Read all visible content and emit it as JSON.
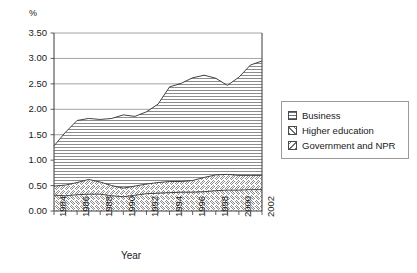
{
  "chart_data": {
    "type": "area",
    "stacked": true,
    "title": "",
    "xlabel": "Year",
    "ylabel": "",
    "yunit": "%",
    "x": [
      1984,
      1985,
      1986,
      1987,
      1988,
      1989,
      1990,
      1991,
      1992,
      1993,
      1994,
      1995,
      1996,
      1997,
      1998,
      1999,
      2000,
      2001,
      2002
    ],
    "xtick_labels": [
      "1984",
      "1986",
      "1988",
      "1990",
      "1992",
      "1994",
      "1996",
      "1998",
      "2000",
      "2002"
    ],
    "xtick_values": [
      1984,
      1986,
      1988,
      1990,
      1992,
      1994,
      1996,
      1998,
      2000,
      2002
    ],
    "xlim": [
      1984,
      2002
    ],
    "ylim": [
      0.0,
      3.5
    ],
    "ytick_labels": [
      "0.00",
      "0.50",
      "1.00",
      "1.50",
      "2.00",
      "2.50",
      "3.00",
      "3.50"
    ],
    "ytick_values": [
      0.0,
      0.5,
      1.0,
      1.5,
      2.0,
      2.5,
      3.0,
      3.5
    ],
    "grid": "horizontal",
    "legend_position": "right",
    "series": [
      {
        "name": "Government and NPR",
        "pattern": "back-diagonal",
        "values": [
          0.31,
          0.3,
          0.32,
          0.33,
          0.33,
          0.3,
          0.28,
          0.31,
          0.34,
          0.35,
          0.36,
          0.37,
          0.37,
          0.38,
          0.4,
          0.41,
          0.41,
          0.42,
          0.42
        ]
      },
      {
        "name": "Higher education",
        "pattern": "forward-diagonal",
        "values": [
          0.18,
          0.21,
          0.24,
          0.29,
          0.24,
          0.2,
          0.17,
          0.18,
          0.19,
          0.21,
          0.22,
          0.21,
          0.23,
          0.28,
          0.31,
          0.31,
          0.29,
          0.28,
          0.28
        ]
      },
      {
        "name": "Business",
        "pattern": "horizontal-lines",
        "values": [
          0.79,
          1.04,
          1.22,
          1.2,
          1.23,
          1.32,
          1.44,
          1.37,
          1.42,
          1.54,
          1.86,
          1.93,
          2.02,
          2.01,
          1.9,
          1.75,
          1.93,
          2.17,
          2.25
        ]
      }
    ],
    "cumulative_top": [
      1.28,
      1.55,
      1.78,
      1.82,
      1.8,
      1.82,
      1.89,
      1.86,
      1.95,
      2.1,
      2.44,
      2.51,
      2.62,
      2.67,
      2.61,
      2.47,
      2.63,
      2.87,
      2.95
    ],
    "cumulative_mid": [
      0.49,
      0.51,
      0.56,
      0.62,
      0.57,
      0.5,
      0.45,
      0.49,
      0.53,
      0.56,
      0.58,
      0.58,
      0.6,
      0.66,
      0.71,
      0.72,
      0.7,
      0.7,
      0.7
    ]
  },
  "legend": {
    "items": [
      {
        "label": "Business",
        "swatch": "horizontal-lines-swatch"
      },
      {
        "label": "Higher education",
        "swatch": "forward-diagonal-swatch"
      },
      {
        "label": "Government and NPR",
        "swatch": "back-diagonal-swatch"
      }
    ]
  }
}
